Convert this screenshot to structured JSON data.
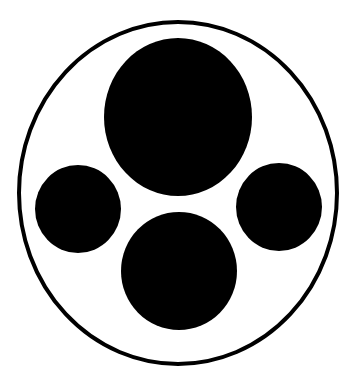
{
  "figure": {
    "width": 355,
    "height": 384,
    "background": "#ffffff",
    "fill_color": "#000000",
    "outer_ring": {
      "cx": 178,
      "cy": 193,
      "rx": 159,
      "ry": 171,
      "stroke_width": 4
    },
    "circles": [
      {
        "name": "top-large-circle",
        "cx": 178,
        "cy": 117,
        "rx": 74,
        "ry": 79
      },
      {
        "name": "left-circle",
        "cx": 78,
        "cy": 209,
        "rx": 43,
        "ry": 44
      },
      {
        "name": "right-circle",
        "cx": 279,
        "cy": 207,
        "rx": 43,
        "ry": 44
      },
      {
        "name": "bottom-circle",
        "cx": 179,
        "cy": 271,
        "rx": 58,
        "ry": 59
      }
    ]
  }
}
